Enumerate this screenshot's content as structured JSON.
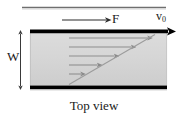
{
  "figure": {
    "caption": "Top view",
    "labels": {
      "force": "F",
      "velocity_symbol": "v",
      "velocity_subscript": "0",
      "width": "W"
    },
    "colors": {
      "fluid_fill": "#d7d7d7",
      "fluid_fill_edge": "#cfcfcf",
      "plate": "#000000",
      "profile_arrow": "#8c8c8c",
      "profile_line": "#9a9a9a",
      "rule": "#7a7a7a",
      "text": "#1a1a1a"
    },
    "geometry": {
      "channel_left": 30,
      "channel_right": 167,
      "channel_top": 31,
      "channel_bottom": 88,
      "top_plate_thickness": 4,
      "bottom_plate_thickness": 4,
      "profile_base_x": 69,
      "main_arrow_tip_x": 176,
      "force_arrow_start_x": 62,
      "force_arrow_end_x": 110,
      "force_arrow_y": 20,
      "top_rule_left": 22,
      "top_rule_right": 166,
      "top_rule_y": 7,
      "width_arrow_x": 20,
      "width_arrow_top": 31,
      "width_arrow_bottom": 88
    },
    "velocity_profile": {
      "description": "linear Couette velocity profile, arrows decreasing in length from moving top plate to stationary bottom plate",
      "arrow_rows_y": [
        38,
        47,
        56,
        65,
        74,
        83
      ],
      "arrow_tip_x": [
        152,
        135,
        118,
        101,
        85,
        71
      ],
      "arrow_fractions": [
        1.0,
        0.8,
        0.6,
        0.4,
        0.2,
        0.02
      ]
    }
  }
}
